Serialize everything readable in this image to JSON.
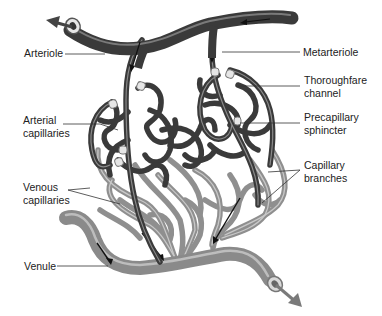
{
  "figure": {
    "colors": {
      "arterial": "#3a3a3a",
      "arterial_highlight": "#8a8a8a",
      "venous": "#8f8f8f",
      "venous_highlight": "#c8c8c8",
      "sphincter": "#e4e4e4",
      "leader": "#333333",
      "background": "#ffffff"
    },
    "labels": {
      "arteriole": "Arteriole",
      "metarteriole": "Metarteriole",
      "thoroughfare_1": "Thoroughfare",
      "thoroughfare_2": "channel",
      "precapillary_1": "Precapillary",
      "precapillary_2": "sphincter",
      "capillary_branches_1": "Capillary",
      "capillary_branches_2": "branches",
      "arterial_caps_1": "Arterial",
      "arterial_caps_2": "capillaries",
      "venous_caps_1": "Venous",
      "venous_caps_2": "capillaries",
      "venule": "Venule"
    }
  }
}
